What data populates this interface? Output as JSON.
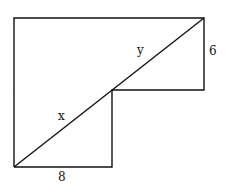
{
  "diagram": {
    "type": "geometry-figure",
    "labels": {
      "x": "x",
      "y": "y",
      "right_side": "6",
      "bottom_side": "8"
    },
    "stroke_color": "#111111",
    "background": "#ffffff"
  }
}
